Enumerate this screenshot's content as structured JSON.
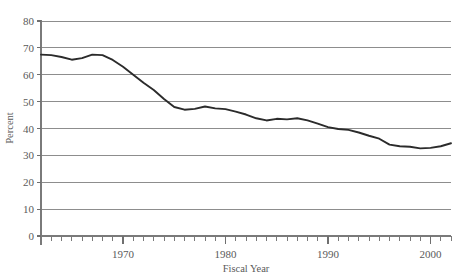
{
  "chart_data": {
    "type": "line",
    "title": "",
    "xlabel": "Fiscal Year",
    "ylabel": "Percent",
    "xlim": [
      1962,
      2002
    ],
    "ylim": [
      0,
      80
    ],
    "grid": true,
    "legend": "none",
    "y_ticks": [
      0,
      10,
      20,
      30,
      40,
      50,
      60,
      70,
      80
    ],
    "y_tick_labels": [
      "0",
      "10",
      "20",
      "30",
      "40",
      "50",
      "60",
      "70",
      "80"
    ],
    "x_ticks_major": [
      1970,
      1980,
      1990,
      2000
    ],
    "x_tick_labels": [
      "1970",
      "1980",
      "1990",
      "2000"
    ],
    "x_minor_tick_interval": 1,
    "series": [
      {
        "name": "Percent",
        "color": "#2b2b2b",
        "x": [
          1962,
          1963,
          1964,
          1965,
          1966,
          1967,
          1968,
          1969,
          1970,
          1971,
          1972,
          1973,
          1974,
          1975,
          1976,
          1977,
          1978,
          1979,
          1980,
          1981,
          1982,
          1983,
          1984,
          1985,
          1986,
          1987,
          1988,
          1989,
          1990,
          1991,
          1992,
          1993,
          1994,
          1995,
          1996,
          1997,
          1998,
          1999,
          2000,
          2001,
          2002
        ],
        "values": [
          67.5,
          67.3,
          66.6,
          65.6,
          66.2,
          67.5,
          67.3,
          65.5,
          63.0,
          60.0,
          57.0,
          54.3,
          51.0,
          48.0,
          47.0,
          47.3,
          48.2,
          47.5,
          47.2,
          46.3,
          45.2,
          43.8,
          43.0,
          43.6,
          43.4,
          43.8,
          43.0,
          41.8,
          40.5,
          39.8,
          39.5,
          38.5,
          37.3,
          36.2,
          34.0,
          33.4,
          33.2,
          32.6,
          32.8,
          33.4,
          34.5
        ]
      }
    ]
  },
  "axis_titles": {
    "x": "Fiscal Year",
    "y": "Percent"
  }
}
